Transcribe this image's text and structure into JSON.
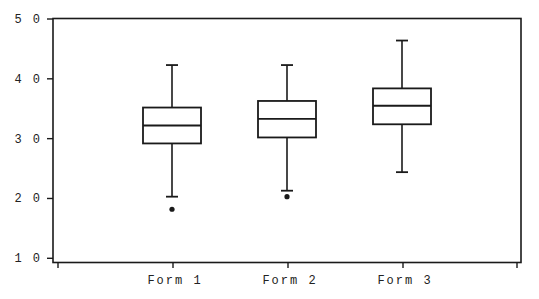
{
  "chart_data": {
    "type": "box",
    "title": "",
    "xlabel": "",
    "ylabel": "",
    "ylim": [
      10,
      50
    ],
    "yticks": [
      10,
      20,
      30,
      40,
      50
    ],
    "ytick_labels": [
      "1 0",
      "2 0",
      "3 0",
      "4 0",
      "5 0"
    ],
    "grid": false,
    "legend": null,
    "categories": [
      "Form 1",
      "Form 2",
      "Form 3"
    ],
    "series": [
      {
        "name": "Form 1",
        "whisker_high": 42.3,
        "q3": 35.2,
        "median": 32.2,
        "q1": 29.2,
        "whisker_low": 20.3,
        "outliers": [
          18.2
        ]
      },
      {
        "name": "Form 2",
        "whisker_high": 42.3,
        "q3": 36.3,
        "median": 33.3,
        "q1": 30.2,
        "whisker_low": 21.3,
        "outliers": [
          20.3
        ]
      },
      {
        "name": "Form 3",
        "whisker_high": 46.4,
        "q3": 38.4,
        "median": 35.5,
        "q1": 32.4,
        "whisker_low": 24.4,
        "outliers": []
      }
    ]
  },
  "style": {
    "line_color": "#1a1a1a",
    "background": "#ffffff"
  }
}
